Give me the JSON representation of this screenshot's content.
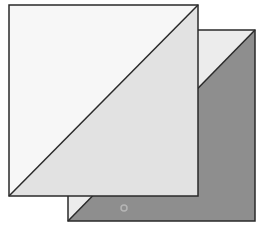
{
  "diagram": {
    "colors": {
      "background": "#ffffff",
      "front_light": "#f7f7f7",
      "front_dark": "#e2e2e2",
      "back_light": "#ececec",
      "back_dark": "#8e8e8e",
      "stroke": "#2a2a2a",
      "dot": "#b0b0b0"
    },
    "front_square": {
      "x1": 9,
      "y1": 5,
      "x2": 198,
      "y2": 196
    },
    "back_square": {
      "x1": 68,
      "y1": 30,
      "x2": 255,
      "y2": 221
    },
    "dot": {
      "cx": 124,
      "cy": 208,
      "r": 3
    }
  }
}
